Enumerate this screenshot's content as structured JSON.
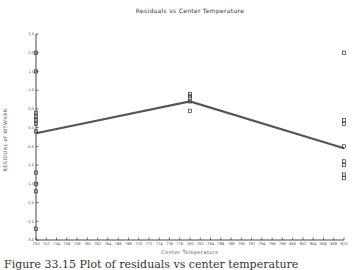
{
  "chart_data": {
    "type": "scatter",
    "title": "Residuals vs Center Temperature",
    "xlabel": "Center Temperature",
    "ylabel": "RESIDUAL of WTWVAR",
    "xlim": [
      750,
      810
    ],
    "ylim": [
      -3.0,
      2.5
    ],
    "x_ticks": [
      750,
      752,
      754,
      756,
      758,
      760,
      762,
      764,
      766,
      768,
      770,
      772,
      774,
      776,
      778,
      780,
      782,
      784,
      786,
      788,
      790,
      792,
      794,
      796,
      798,
      800,
      802,
      804,
      806,
      808,
      810
    ],
    "y_ticks": [
      2.5,
      2.0,
      1.5,
      1.0,
      0.5,
      0.0,
      -0.5,
      -1.0,
      -1.5,
      -2.0,
      -2.5,
      -3.0
    ],
    "y_tick_labels": [
      "2.5",
      "2.0",
      "1.5",
      "1.0",
      "0.5",
      "0.0",
      "-0.5",
      "-1.0",
      "-1.5",
      "-2.0",
      "-2.5",
      "-3.0"
    ],
    "grid": false,
    "marker": "square",
    "series": [
      {
        "name": "residuals",
        "points": [
          {
            "x": 750,
            "y": 2.0
          },
          {
            "x": 750,
            "y": 1.5
          },
          {
            "x": 750,
            "y": 0.4
          },
          {
            "x": 750,
            "y": 0.3
          },
          {
            "x": 750,
            "y": 0.2
          },
          {
            "x": 750,
            "y": 0.1
          },
          {
            "x": 750,
            "y": -0.1
          },
          {
            "x": 750,
            "y": -1.2
          },
          {
            "x": 750,
            "y": -1.5
          },
          {
            "x": 750,
            "y": -1.7
          },
          {
            "x": 750,
            "y": -2.7
          },
          {
            "x": 780,
            "y": 0.9
          },
          {
            "x": 780,
            "y": 0.85
          },
          {
            "x": 780,
            "y": 0.8
          },
          {
            "x": 780,
            "y": 0.7
          },
          {
            "x": 780,
            "y": 0.45
          },
          {
            "x": 810,
            "y": 2.0
          },
          {
            "x": 810,
            "y": 0.2
          },
          {
            "x": 810,
            "y": 0.1
          },
          {
            "x": 810,
            "y": -0.5
          },
          {
            "x": 810,
            "y": -0.9
          },
          {
            "x": 810,
            "y": -1.0
          },
          {
            "x": 810,
            "y": -1.25
          },
          {
            "x": 810,
            "y": -1.35
          }
        ]
      },
      {
        "name": "mean residual line",
        "type": "line",
        "x": [
          750,
          780,
          810
        ],
        "y": [
          -0.15,
          0.7,
          -0.55
        ]
      }
    ]
  },
  "caption": {
    "text": "Figure 33.15   Plot of residuals vs center temperature"
  }
}
